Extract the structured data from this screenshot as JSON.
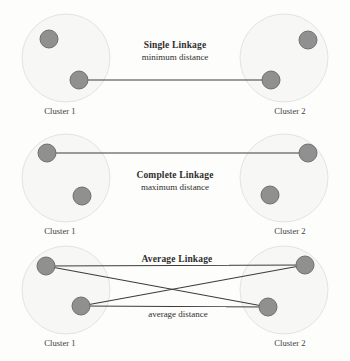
{
  "figure": {
    "background_color": "#fdfdfc",
    "cluster_fill": "#f7f7f6",
    "cluster_stroke": "#e2e2e0",
    "point_fill": "#909090",
    "point_stroke": "#6f6f6f",
    "line_color": "#3c3c3c",
    "text_color": "#2f2f2f"
  },
  "panels": [
    {
      "id": "single-linkage",
      "title": "Single Linkage",
      "subtitle": "minimum distance",
      "left_cluster_label": "Cluster 1",
      "right_cluster_label": "Cluster 2",
      "edge_label": ""
    },
    {
      "id": "complete-linkage",
      "title": "Complete Linkage",
      "subtitle": "maximum distance",
      "left_cluster_label": "Cluster 1",
      "right_cluster_label": "Cluster 2",
      "edge_label": ""
    },
    {
      "id": "average-linkage",
      "title": "Average Linkage",
      "subtitle": "",
      "left_cluster_label": "Cluster 1",
      "right_cluster_label": "Cluster 2",
      "edge_label": "average distance"
    }
  ]
}
